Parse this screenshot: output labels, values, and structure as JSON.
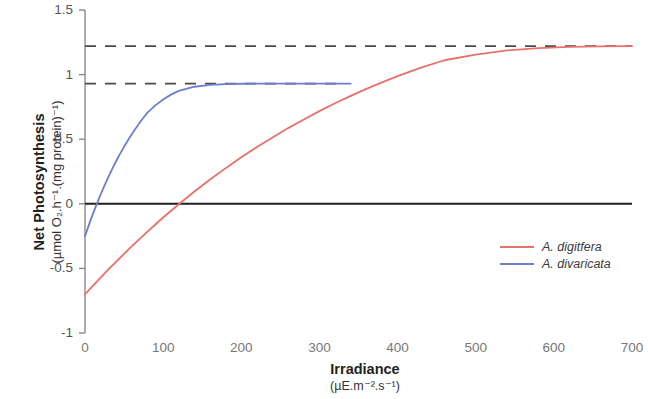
{
  "chart_data": {
    "type": "line",
    "title": "",
    "xlabel": "Irradiance",
    "xlabel_units": "(µE.m⁻².s⁻¹)",
    "ylabel": "Net Photosynthesis",
    "ylabel_units": "(µmol O₂.h⁻¹.(mg protein)⁻¹)",
    "xlim": [
      0,
      700
    ],
    "ylim": [
      -1,
      1.5
    ],
    "xticks": [
      "0",
      "100",
      "200",
      "300",
      "400",
      "500",
      "600",
      "700"
    ],
    "xtick_values": [
      0,
      100,
      200,
      300,
      400,
      500,
      600,
      700
    ],
    "yticks": [
      "-1",
      "-0.5",
      "0",
      "0.5",
      "1",
      "1.5"
    ],
    "ytick_values": [
      -1,
      -0.5,
      0,
      0.5,
      1,
      1.5
    ],
    "grid": false,
    "legend_position": "center-right",
    "series": [
      {
        "name": "A. digitfera",
        "color": "#E8716A",
        "style": "solid",
        "x": [
          0,
          10,
          20,
          30,
          40,
          50,
          60,
          70,
          80,
          90,
          100,
          120,
          140,
          160,
          180,
          200,
          220,
          240,
          260,
          280,
          300,
          320,
          340,
          360,
          380,
          400,
          430,
          460,
          500,
          540,
          580,
          620,
          660,
          700
        ],
        "y": [
          -0.7,
          -0.635,
          -0.571,
          -0.508,
          -0.447,
          -0.387,
          -0.328,
          -0.271,
          -0.215,
          -0.16,
          -0.106,
          -0.003,
          0.095,
          0.188,
          0.276,
          0.36,
          0.439,
          0.514,
          0.586,
          0.653,
          0.717,
          0.778,
          0.835,
          0.889,
          0.94,
          0.988,
          1.054,
          1.111,
          1.155,
          1.187,
          1.205,
          1.214,
          1.218,
          1.22
        ]
      },
      {
        "name": "A. divaricata",
        "color": "#6A7FD0",
        "style": "solid",
        "x": [
          0,
          5,
          10,
          15,
          20,
          25,
          30,
          35,
          40,
          45,
          50,
          55,
          60,
          65,
          70,
          75,
          80,
          90,
          100,
          110,
          120,
          140,
          160,
          180,
          200,
          230,
          260,
          290,
          320,
          340
        ],
        "y": [
          -0.25,
          -0.163,
          -0.08,
          -0.002,
          0.072,
          0.142,
          0.209,
          0.272,
          0.331,
          0.388,
          0.441,
          0.492,
          0.54,
          0.585,
          0.628,
          0.668,
          0.706,
          0.762,
          0.808,
          0.845,
          0.874,
          0.906,
          0.921,
          0.927,
          0.929,
          0.93,
          0.93,
          0.93,
          0.93,
          0.93
        ]
      }
    ],
    "reference_lines": [
      {
        "name": "asymptote-digitfera",
        "value": 1.22,
        "style": "dashed",
        "color": "#4a4a4a",
        "x_from": 0,
        "x_to": 700
      },
      {
        "name": "asymptote-divaricata",
        "value": 0.93,
        "style": "dashed",
        "color": "#4a4a4a",
        "x_from": 0,
        "x_to": 330
      },
      {
        "name": "zero-line",
        "value": 0,
        "style": "solid",
        "color": "#1f1f1f",
        "x_from": 0,
        "x_to": 700
      }
    ]
  },
  "legend": {
    "items": [
      {
        "label": "A. digitfera",
        "color": "#E8716A"
      },
      {
        "label": "A. divaricata",
        "color": "#6A7FD0"
      }
    ]
  },
  "axes": {
    "y_title_main": "Net Photosynthesis",
    "y_title_sub": "(µmol O₂.h⁻¹.(mg protein)⁻¹)",
    "x_title_main": "Irradiance",
    "x_title_sub": "(µE.m⁻².s⁻¹)"
  }
}
